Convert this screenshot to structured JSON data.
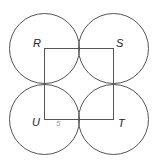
{
  "diagram": {
    "type": "geometry",
    "stroke_color": "#555555",
    "square": {
      "vertices": [
        "R",
        "S",
        "T",
        "U"
      ]
    },
    "labels": {
      "R": "R",
      "S": "S",
      "T": "T",
      "U": "U",
      "side_mark": "5"
    },
    "circles": [
      {
        "center": "R"
      },
      {
        "center": "S"
      },
      {
        "center": "T"
      },
      {
        "center": "U"
      }
    ]
  }
}
